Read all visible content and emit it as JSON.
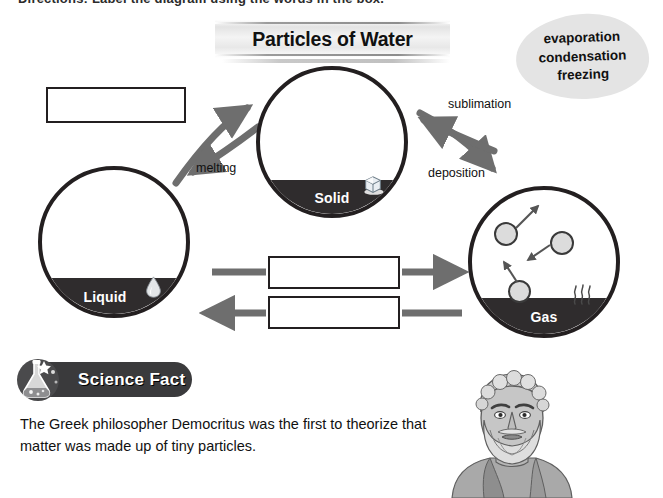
{
  "header": {
    "cropped_line": "Directions: Label the diagram using the words in the box."
  },
  "title": {
    "text": "Particles of Water"
  },
  "word_bank": {
    "words": [
      "evaporation",
      "condensation",
      "freezing"
    ]
  },
  "states": [
    {
      "id": "solid",
      "label": "Solid",
      "icon": "ice-cube-icon"
    },
    {
      "id": "liquid",
      "label": "Liquid",
      "icon": "water-drop-icon"
    },
    {
      "id": "gas",
      "label": "Gas",
      "icon": "steam-icon"
    }
  ],
  "blanks": [
    {
      "id": "blank-1",
      "value": "",
      "placeholder": ""
    },
    {
      "id": "blank-2",
      "value": "",
      "placeholder": ""
    },
    {
      "id": "blank-3",
      "value": "",
      "placeholder": ""
    }
  ],
  "arrow_labels": {
    "melting": "melting",
    "sublimation": "sublimation",
    "deposition": "deposition"
  },
  "science_fact": {
    "banner_label": "Science Fact",
    "body": "The Greek philosopher Democritus was the first to theorize that matter was made up of tiny particles.",
    "illustration": "democritus-bust-illustration"
  },
  "colors": {
    "ink": "#231f20",
    "band": "#2f2c2d",
    "arrow": "#6e6e6e",
    "blob": "#e4e4e4",
    "banner": "#3a3a3c",
    "particle_fill": "#dcdcdc"
  }
}
